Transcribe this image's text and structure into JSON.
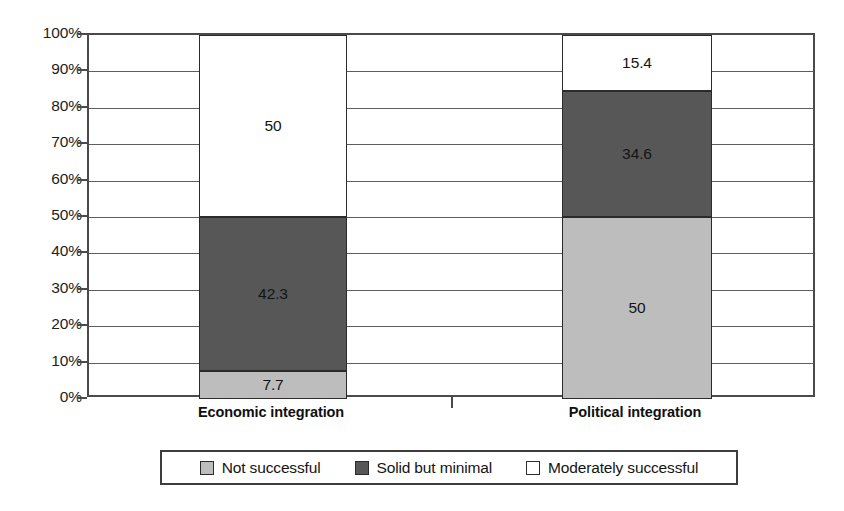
{
  "chart_data": {
    "type": "bar",
    "subtype": "stacked-100-percent",
    "title": "",
    "xlabel": "",
    "ylabel": "",
    "ylim": [
      0,
      100
    ],
    "grid": true,
    "legend_position": "bottom",
    "categories": [
      "Economic integration",
      "Political integration"
    ],
    "ytick_labels": [
      "100%",
      "90%",
      "80%",
      "70%",
      "60%",
      "50%",
      "40%",
      "30%",
      "20%",
      "10%",
      "0%"
    ],
    "ytick_values": [
      100,
      90,
      80,
      70,
      60,
      50,
      40,
      30,
      20,
      10,
      0
    ],
    "series": [
      {
        "name": "Not successful",
        "color": "#bdbdbd",
        "values": [
          7.7,
          50
        ],
        "labels": [
          "7.7",
          "50"
        ]
      },
      {
        "name": "Solid but minimal",
        "color": "#575757",
        "values": [
          42.3,
          34.6
        ],
        "labels": [
          "42.3",
          "34.6"
        ]
      },
      {
        "name": "Moderately successful",
        "color": "#ffffff",
        "values": [
          50,
          15.4
        ],
        "labels": [
          "50",
          "15.4"
        ]
      }
    ]
  },
  "legend": {
    "items": [
      {
        "label": "Not successful",
        "swatch": "#bdbdbd"
      },
      {
        "label": "Solid but minimal",
        "swatch": "#575757"
      },
      {
        "label": "Moderately successful",
        "swatch": "#ffffff"
      }
    ]
  },
  "colors": {
    "not_successful": "#bdbdbd",
    "solid_but_minimal": "#575757",
    "moderately_successful": "#ffffff",
    "axis": "#4a4a4a",
    "gridline": "#5d5d5d",
    "segment_border": "#2b2b2b",
    "text": "#141414",
    "background": "#ffffff"
  }
}
